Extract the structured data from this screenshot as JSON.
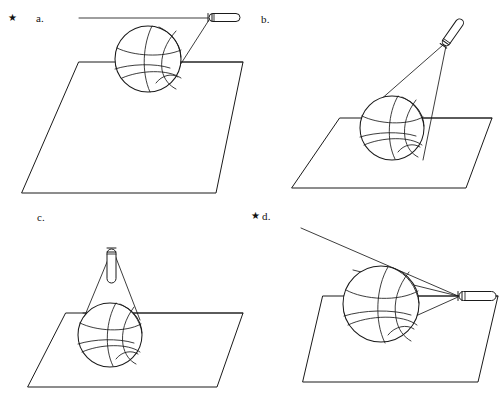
{
  "figure": {
    "type": "geometry-optics-diagram",
    "width": 501,
    "height": 404,
    "background_color": "#ffffff",
    "line_color": "#1a1a1a",
    "star_glyph": "★",
    "panels": [
      {
        "id": "a",
        "label": "a.",
        "starred": true,
        "star": "★",
        "light_source": "flashlight",
        "flashlight_orientation": "horizontal, pointing left",
        "flashlight_position": "upper right, level with top of ball",
        "ball": "basketball",
        "surface": "plane (parallelogram)",
        "description": "Flashlight at right edge aimed horizontally to the left, grazing the top of the ball; shadow cast across the plane."
      },
      {
        "id": "b",
        "label": "b.",
        "starred": false,
        "star": "",
        "light_source": "flashlight",
        "flashlight_orientation": "tilted, pointing down-left",
        "flashlight_position": "upper right, above the plane",
        "ball": "basketball",
        "surface": "plane (parallelogram)",
        "description": "Flashlight above and to the right aimed diagonally down at the ball resting on the plane."
      },
      {
        "id": "c",
        "label": "c.",
        "starred": false,
        "star": "",
        "light_source": "flashlight",
        "flashlight_orientation": "vertical, pointing straight down",
        "flashlight_position": "directly above the ball",
        "ball": "basketball",
        "surface": "plane (parallelogram)",
        "description": "Flashlight directly overhead shining straight down onto the ball."
      },
      {
        "id": "d",
        "label": "d.",
        "starred": true,
        "star": "★",
        "light_source": "flashlight",
        "flashlight_orientation": "horizontal, pointing left",
        "flashlight_position": "right side, low, near the plane surface",
        "ball": "basketball",
        "surface": "plane (parallelogram)",
        "description": "Flashlight low at the right aimed horizontally across the plane at the ball, light rays spreading up-left past the ball."
      }
    ]
  }
}
